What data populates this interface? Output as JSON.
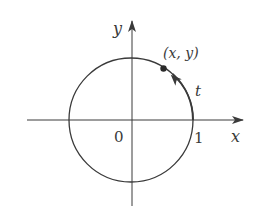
{
  "figure": {
    "type": "unit-circle-diagram",
    "axes": {
      "x_label": "x",
      "y_label": "y",
      "origin_label": "0",
      "unit_tick_label": "1"
    },
    "circle": {
      "description": "unit circle centered at origin",
      "radius": 1
    },
    "point": {
      "label": "(x, y)"
    },
    "arc": {
      "label": "t",
      "direction": "counterclockwise from (1,0) to (x, y)"
    },
    "colors": {
      "stroke": "#3a3a3a",
      "background": "#ffffff"
    }
  }
}
